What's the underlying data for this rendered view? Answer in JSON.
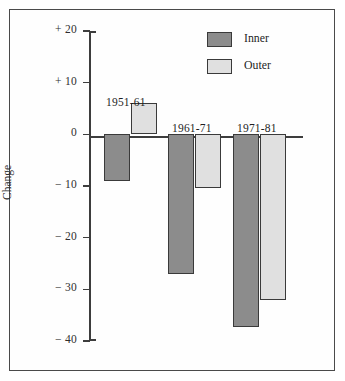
{
  "chart_data": {
    "type": "bar",
    "title": "",
    "xlabel": "",
    "ylabel": "Change",
    "ylim": [
      -40,
      20
    ],
    "yticks": [
      20,
      10,
      0,
      -10,
      -20,
      -30,
      -40
    ],
    "ytick_labels": [
      "+ 20",
      "+ 10",
      "0",
      "− 10",
      "− 20",
      "− 30",
      "− 40"
    ],
    "grid": false,
    "zero_line": true,
    "legend_position": "top-right",
    "categories": [
      "1951-61",
      "1961-71",
      "1971-81"
    ],
    "series": [
      {
        "name": "Inner",
        "color": "#8c8c8c",
        "values": [
          -9,
          -27,
          -37.3
        ]
      },
      {
        "name": "Outer",
        "color": "#e0e0e0",
        "values": [
          6,
          -10.3,
          -32
        ]
      }
    ]
  },
  "legend": {
    "items": [
      {
        "label": "Inner",
        "swatch": "inner"
      },
      {
        "label": "Outer",
        "swatch": "outer"
      }
    ]
  },
  "colors": {
    "inner": "#8c8c8c",
    "outer": "#e0e0e0",
    "axis": "#3d3d3d",
    "border": "#4a4a4a",
    "background": "#ffffff"
  }
}
